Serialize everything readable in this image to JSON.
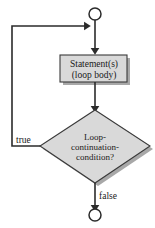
{
  "diagram": {
    "colors": {
      "shape_fill": "#d9d9d9",
      "shape_stroke": "#3a3a3a",
      "shadow": "#a8a8a8",
      "line": "#2b2b2b",
      "background": "#ffffff",
      "text": "#1a1a1a"
    },
    "nodes": {
      "start_terminal": {
        "shape": "circle",
        "label": ""
      },
      "statement_box": {
        "shape": "rectangle",
        "line1": "Statement(s)",
        "line2": "(loop body)"
      },
      "condition_diamond": {
        "shape": "diamond",
        "line1": "Loop-",
        "line2": "continuation-",
        "line3": "condition?"
      },
      "end_terminal": {
        "shape": "circle",
        "label": ""
      }
    },
    "edges": {
      "true_label": "true",
      "false_label": "false"
    }
  }
}
